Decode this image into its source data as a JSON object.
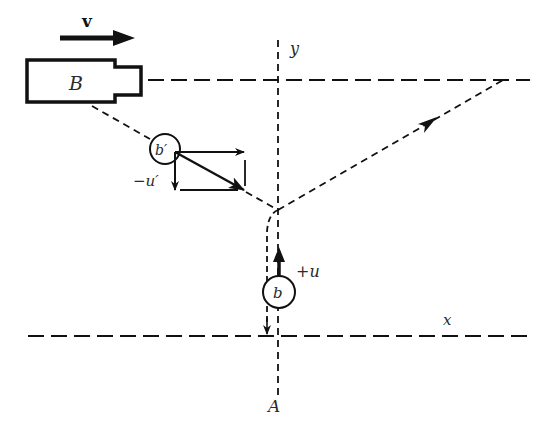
{
  "diagram": {
    "type": "physics vector diagram",
    "labels": {
      "velocity": "v",
      "box": "B",
      "y_axis": "y",
      "x_axis": "x",
      "origin_point": "A",
      "ball_moving": "b",
      "ball_reflected": "b′",
      "plus_u": "+u",
      "minus_u_prime": "−u′"
    },
    "colors": {
      "ink": "#111111",
      "background": "#ffffff"
    }
  }
}
